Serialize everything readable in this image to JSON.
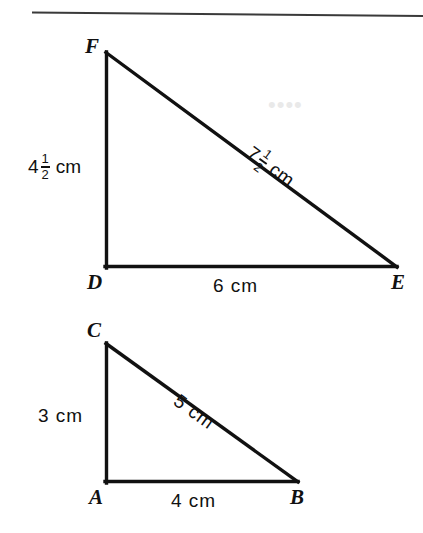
{
  "figure": {
    "background_color": "#ffffff",
    "stroke_color": "#111111",
    "rule": {
      "name": "top-horizontal-rule",
      "color": "#3a3a3a"
    },
    "triangles": [
      {
        "id": "DEF",
        "vertices": [
          {
            "label": "F",
            "x": 106,
            "y": 52
          },
          {
            "label": "D",
            "x": 106,
            "y": 267
          },
          {
            "label": "E",
            "x": 396,
            "y": 267
          }
        ],
        "sides": [
          {
            "name": "DF",
            "value": "4",
            "fraction_num": "1",
            "fraction_den": "2",
            "unit": "cm",
            "display": "4 1/2 cm"
          },
          {
            "name": "DE",
            "value": "6",
            "unit": "cm",
            "display": "6 cm"
          },
          {
            "name": "FE",
            "value": "7",
            "fraction_num": "1",
            "fraction_den": "2",
            "unit": "cm",
            "display": "7 1/2 cm"
          }
        ]
      },
      {
        "id": "ABC",
        "vertices": [
          {
            "label": "C",
            "x": 106,
            "y": 343
          },
          {
            "label": "A",
            "x": 106,
            "y": 482
          },
          {
            "label": "B",
            "x": 297,
            "y": 482
          }
        ],
        "sides": [
          {
            "name": "AC",
            "value": "3",
            "unit": "cm",
            "display": "3 cm"
          },
          {
            "name": "AB",
            "value": "4",
            "unit": "cm",
            "display": "4 cm"
          },
          {
            "name": "CB",
            "value": "5",
            "unit": "cm",
            "display": "5 cm"
          }
        ]
      }
    ],
    "labels": {
      "vertex_F": "F",
      "vertex_D": "D",
      "vertex_E": "E",
      "vertex_C": "C",
      "vertex_A": "A",
      "vertex_B": "B",
      "side_DF_whole": "4",
      "side_DF_num": "1",
      "side_DF_den": "2",
      "side_DF_unit": "cm",
      "side_DE": "6 cm",
      "side_FE_whole": "7",
      "side_FE_num": "1",
      "side_FE_den": "2",
      "side_FE_unit": "cm",
      "side_AC": "3 cm",
      "side_AB": "4 cm",
      "side_CB": "5 cm"
    }
  }
}
